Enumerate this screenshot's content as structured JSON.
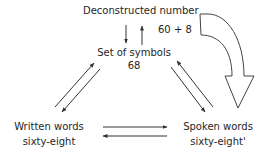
{
  "diagram": {
    "top_node": {
      "title": "Deconstructed number",
      "value": "60 + 8"
    },
    "center_node": {
      "title": "Set of symbols",
      "value": "68"
    },
    "left_node": {
      "title": "Written words",
      "value": "sixty-eight"
    },
    "right_node": {
      "title": "Spoken words",
      "value": "sixty-eight'"
    },
    "edges": [
      {
        "from": "Deconstructed number",
        "to": "Set of symbols",
        "style": "thin-arrow"
      },
      {
        "from": "Set of symbols",
        "to": "Deconstructed number",
        "style": "thin-arrow"
      },
      {
        "from": "Set of symbols",
        "to": "Written words",
        "style": "thin-arrow"
      },
      {
        "from": "Written words",
        "to": "Set of symbols",
        "style": "thin-arrow"
      },
      {
        "from": "Set of symbols",
        "to": "Spoken words",
        "style": "thin-arrow"
      },
      {
        "from": "Spoken words",
        "to": "Set of symbols",
        "style": "thin-arrow"
      },
      {
        "from": "Written words",
        "to": "Spoken words",
        "style": "thin-arrow"
      },
      {
        "from": "Spoken words",
        "to": "Written words",
        "style": "thin-arrow"
      },
      {
        "from": "Deconstructed number",
        "to": "Spoken words",
        "style": "large-curved-hollow-arrow"
      }
    ],
    "colors": {
      "stroke": "#333333",
      "text": "#262626",
      "background": "#ffffff"
    }
  }
}
